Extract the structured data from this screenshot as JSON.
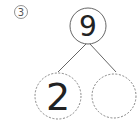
{
  "problem_label": "3",
  "number_bond": {
    "whole": "9",
    "parts": [
      "2",
      ""
    ]
  },
  "colors": {
    "stroke": "#555555",
    "text": "#222222"
  }
}
